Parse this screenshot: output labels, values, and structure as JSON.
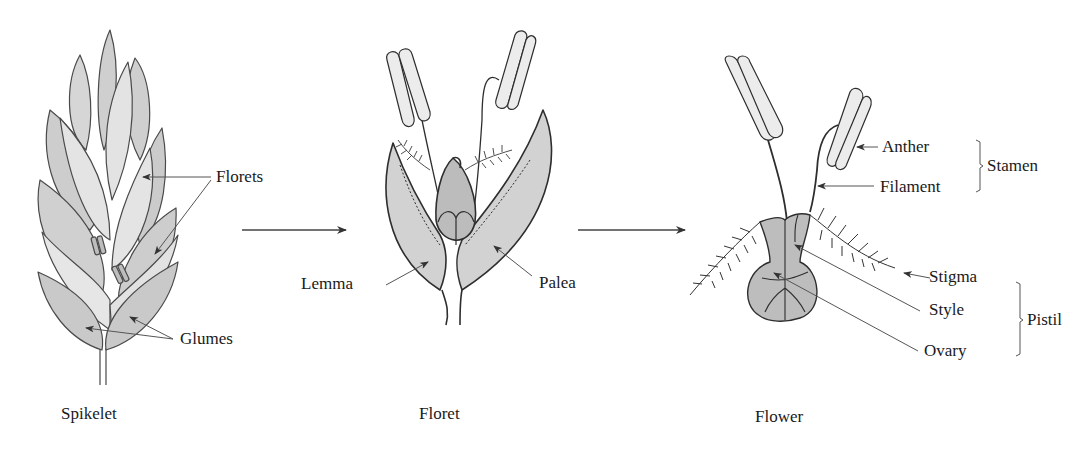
{
  "diagram": {
    "panels": [
      {
        "id": "spikelet",
        "caption": "Spikelet",
        "labels": {
          "florets": "Florets",
          "glumes": "Glumes"
        }
      },
      {
        "id": "floret",
        "caption": "Floret",
        "labels": {
          "lemma": "Lemma",
          "palea": "Palea"
        }
      },
      {
        "id": "flower",
        "caption": "Flower",
        "labels": {
          "anther": "Anther",
          "filament": "Filament",
          "stamen": "Stamen",
          "stigma": "Stigma",
          "style": "Style",
          "ovary": "Ovary",
          "pistil": "Pistil"
        }
      }
    ],
    "flow_arrows": [
      "spikelet-to-floret",
      "floret-to-flower"
    ],
    "colors": {
      "outline": "#3a3a3a",
      "fill_dark": "#c8c8c8",
      "fill_light": "#e6e6e6",
      "anther_fill": "#ececec",
      "text": "#1a1a1a"
    }
  }
}
